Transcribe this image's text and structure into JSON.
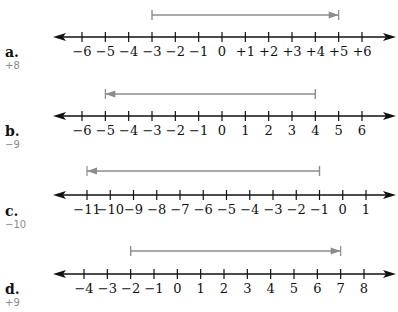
{
  "problems": [
    {
      "letter": "a.",
      "answer": "+8",
      "ticks": [
        "−6",
        "−5",
        "−4",
        "−3",
        "−2",
        "−1",
        "0",
        "+1",
        "+2",
        "+3",
        "+4",
        "+5",
        "+6"
      ],
      "tick_values": [
        -6,
        -5,
        -4,
        -3,
        -2,
        -1,
        0,
        1,
        2,
        3,
        4,
        5,
        6
      ],
      "arrow": {
        "from": -3,
        "to": 5,
        "direction": "right"
      }
    },
    {
      "letter": "b.",
      "answer": "−9",
      "ticks": [
        "−6",
        "−5",
        "−4",
        "−3",
        "−2",
        "−1",
        "0",
        "1",
        "2",
        "3",
        "4",
        "5",
        "6"
      ],
      "tick_values": [
        -6,
        -5,
        -4,
        -3,
        -2,
        -1,
        0,
        1,
        2,
        3,
        4,
        5,
        6
      ],
      "arrow": {
        "from": 4,
        "to": -5,
        "direction": "left"
      }
    },
    {
      "letter": "c.",
      "answer": "−10",
      "ticks": [
        "−11",
        "−10",
        "−9",
        "−8",
        "−7",
        "−6",
        "−5",
        "−4",
        "−3",
        "−2",
        "−1",
        "0",
        "1"
      ],
      "tick_values": [
        -11,
        -10,
        -9,
        -8,
        -7,
        -6,
        -5,
        -4,
        -3,
        -2,
        -1,
        0,
        1
      ],
      "arrow": {
        "from": -1,
        "to": -11,
        "direction": "left"
      }
    },
    {
      "letter": "d.",
      "answer": "+9",
      "ticks": [
        "−4",
        "−3",
        "−2",
        "−1",
        "0",
        "1",
        "2",
        "3",
        "4",
        "5",
        "6",
        "7",
        "8"
      ],
      "tick_values": [
        -4,
        -3,
        -2,
        -1,
        0,
        1,
        2,
        3,
        4,
        5,
        6,
        7,
        8
      ],
      "arrow": {
        "from": -2,
        "to": 7,
        "direction": "right"
      }
    }
  ],
  "colors": {
    "axis": "#111111",
    "arrow": "#8c8c8c",
    "answer": "#8a8a8a"
  }
}
